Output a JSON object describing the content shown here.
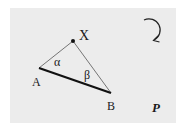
{
  "diagram": {
    "points": {
      "X": {
        "label": "X",
        "x": 73,
        "y": 41
      },
      "A": {
        "label": "A",
        "x": 39,
        "y": 68
      },
      "B": {
        "label": "B",
        "x": 111,
        "y": 93
      }
    },
    "angles": {
      "alpha": "α",
      "beta": "β"
    },
    "plane_label": "P",
    "rotation_icon": "clockwise-arrow-icon",
    "colors": {
      "background": "#ececec",
      "stroke": "#1a1a1a"
    }
  }
}
